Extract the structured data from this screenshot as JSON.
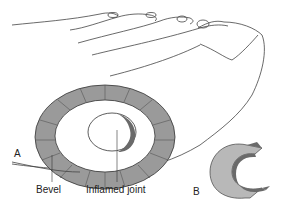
{
  "figure": {
    "panel_a_label": "A",
    "panel_b_label": "B",
    "labels": {
      "bevel": "Bevel",
      "inflamed_joint": "Inflamed joint"
    },
    "colors": {
      "line": "#333333",
      "bevel_fill": "#9a9a9a",
      "pad_fill": "#ffffff",
      "c_light": "#b8b8b8",
      "c_dark": "#6a6a6a"
    }
  }
}
